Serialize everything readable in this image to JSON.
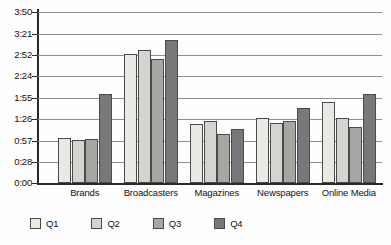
{
  "chart_data": {
    "type": "bar",
    "title": "",
    "xlabel": "",
    "ylabel": "",
    "grid": true,
    "legend_position": "bottom-left",
    "categories": [
      "Brands",
      "Broadcasters",
      "Magazines",
      "Newspapers",
      "Online Media"
    ],
    "y_tick_labels": [
      "3:50",
      "3:21",
      "2:52",
      "2:24",
      "1:55",
      "1:26",
      "0:57",
      "0:28",
      "0:00"
    ],
    "y_tick_minutes": [
      230,
      201,
      172,
      144,
      115,
      86,
      57,
      28,
      0
    ],
    "ylim_minutes": [
      0,
      230
    ],
    "value_format": "h:mm",
    "series": [
      {
        "name": "Q1",
        "color": "#e9e9e6",
        "values": [
          "1:00",
          "2:54",
          "1:20",
          "1:28",
          "1:49"
        ],
        "values_minutes": [
          60,
          174,
          80,
          88,
          109
        ]
      },
      {
        "name": "Q2",
        "color": "#d4d4d0",
        "values": [
          "0:58",
          "2:59",
          "1:23",
          "1:21",
          "1:28"
        ],
        "values_minutes": [
          58,
          179,
          83,
          81,
          88
        ]
      },
      {
        "name": "Q3",
        "color": "#a6a6a2",
        "values": [
          "0:59",
          "2:47",
          "1:06",
          "1:24",
          "1:16"
        ],
        "values_minutes": [
          59,
          167,
          66,
          84,
          76
        ]
      },
      {
        "name": "Q4",
        "color": "#78787a",
        "values": [
          "2:00",
          "3:12",
          "1:12",
          "1:41",
          "2:00"
        ],
        "values_minutes": [
          120,
          192,
          72,
          101,
          120
        ]
      }
    ]
  },
  "legend": {
    "items": [
      {
        "label": "Q1"
      },
      {
        "label": "Q2"
      },
      {
        "label": "Q3"
      },
      {
        "label": "Q4"
      }
    ]
  }
}
